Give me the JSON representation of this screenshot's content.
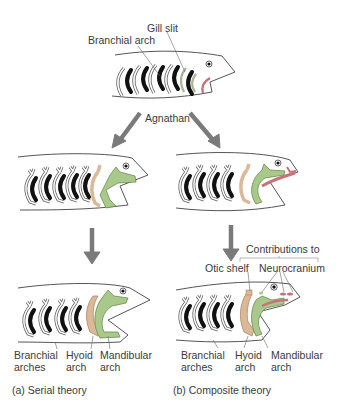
{
  "diagram": {
    "top": {
      "labels": {
        "gill_slit": "Gill slit",
        "branchial_arch": "Branchial arch"
      },
      "arrow_label": "Agnathan"
    },
    "serial": {
      "labels": {
        "branchial": [
          "Branchial",
          "arches"
        ],
        "hyoid": [
          "Hyoid",
          "arch"
        ],
        "mandibular": [
          "Mandibular",
          "arch"
        ]
      },
      "caption": "(a) Serial theory"
    },
    "composite": {
      "contributions": "Contributions to",
      "otic_shelf": "Otic shelf",
      "neurocranium": "Neurocranium",
      "labels": {
        "branchial": [
          "Branchial",
          "arches"
        ],
        "hyoid": [
          "Hyoid",
          "arch"
        ],
        "mandibular": [
          "Mandibular",
          "arch"
        ]
      },
      "caption": "(b) Composite theory"
    },
    "colors": {
      "mandibular": "#a8c98a",
      "hyoid": "#dcb896",
      "pink": "#c9707a",
      "arrow": "#7a7a7a",
      "outline": "#555555",
      "slit": "#111111"
    }
  }
}
